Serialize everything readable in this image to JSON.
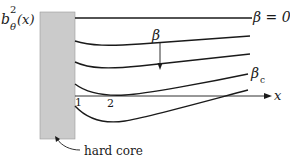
{
  "figure": {
    "y_label_base": "b",
    "y_label_sup": "2",
    "y_label_sub": "θ",
    "y_label_arg": "(x)",
    "x_label": "x",
    "tick_1": "1",
    "tick_2": "2",
    "curve_label_top": "β = 0",
    "beta_arrow_label": "β",
    "curve_label_critical_base": "β",
    "curve_label_critical_sub": "c",
    "hard_core_label": "hard core"
  },
  "colors": {
    "hard_core_fill": "#c8c8c8",
    "line": "#1a1a1a"
  }
}
